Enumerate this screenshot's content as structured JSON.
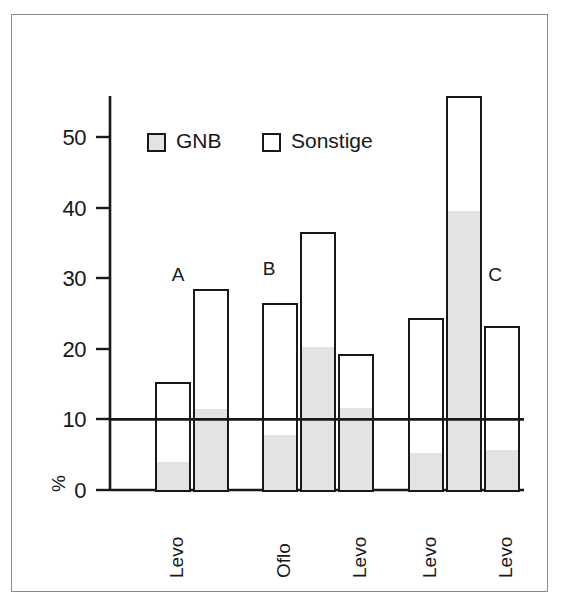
{
  "chart_data": {
    "type": "bar",
    "title": "",
    "subtitle": "",
    "xlabel": "",
    "ylabel": "%",
    "ylim": [
      0,
      57
    ],
    "yticks": [
      0,
      10,
      20,
      30,
      40,
      50
    ],
    "ytick_labels": [
      "0",
      "10",
      "20",
      "30",
      "40",
      "50"
    ],
    "grid": false,
    "legend_position": "top-left-inside",
    "stacked": true,
    "reference_line": {
      "value": 10,
      "label": ""
    },
    "legend": [
      {
        "name": "GNB",
        "swatch": "gray-filled-square",
        "color": "#e3e3e3"
      },
      {
        "name": "Sonstige",
        "swatch": "white-square",
        "color": "#ffffff"
      }
    ],
    "series": [
      {
        "name": "GNB",
        "values": [
          4.0,
          11.5,
          7.8,
          20.3,
          11.6,
          5.2,
          39.5,
          5.7
        ]
      },
      {
        "name": "Sonstige",
        "values": [
          15.3,
          28.5,
          26.5,
          36.5,
          19.2,
          24.3,
          55.8,
          23.3
        ]
      }
    ],
    "note_series_meaning": "Sonstige values are the total bar heights; GNB is the shaded lower portion of each bar.",
    "categories": [
      "Levo",
      "",
      "Oflo",
      "",
      "Levo",
      "Levo",
      "",
      "Levo"
    ],
    "xtick_labels": [
      "Levo",
      "Oflo",
      "Levo",
      "Levo",
      "Levo"
    ],
    "group_labels": [
      "A",
      "B",
      "C"
    ],
    "bars": [
      {
        "group": "A",
        "xtick": "Levo",
        "total": 15.3,
        "gnb": 4.0
      },
      {
        "group": "A",
        "xtick": "",
        "total": 28.5,
        "gnb": 11.5
      },
      {
        "group": "B",
        "xtick": "Oflo",
        "total": 26.5,
        "gnb": 7.8
      },
      {
        "group": "B",
        "xtick": "",
        "total": 36.5,
        "gnb": 20.3
      },
      {
        "group": "B",
        "xtick": "Levo",
        "total": 19.2,
        "gnb": 11.6
      },
      {
        "group": "C",
        "xtick": "Levo",
        "total": 24.3,
        "gnb": 5.2
      },
      {
        "group": "C",
        "xtick": "",
        "total": 55.8,
        "gnb": 39.5
      },
      {
        "group": "C",
        "xtick": "Levo",
        "total": 23.3,
        "gnb": 5.7
      }
    ]
  },
  "axis": {
    "y_label": "%",
    "tick_0": "0",
    "tick_10": "10",
    "tick_20": "20",
    "tick_30": "30",
    "tick_40": "40",
    "tick_50": "50"
  },
  "legend": {
    "gnb_label": "GNB",
    "sonstige_label": "Sonstige"
  },
  "groups": {
    "a": "A",
    "b": "B",
    "c": "C"
  },
  "xticks": {
    "t0": "Levo",
    "t1": "Oflo",
    "t2": "Levo",
    "t3": "Levo",
    "t4": "Levo"
  },
  "colors": {
    "ink": "#16181a",
    "gnb_fill": "#e3e3e3",
    "sonstige_fill": "#ffffff",
    "frame": "#8a8a8a"
  }
}
